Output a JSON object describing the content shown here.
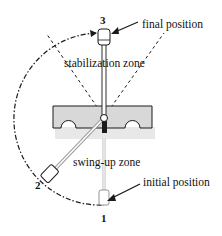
{
  "diagram": {
    "type": "pendulum-on-cart zones",
    "labels": {
      "final_position": "final position",
      "stabilization_zone": "stabilization zone",
      "swing_up_zone": "swing-up zone",
      "initial_position": "initial position"
    },
    "positions": [
      {
        "id": "1",
        "label": "1",
        "description": "initial position (hanging down)"
      },
      {
        "id": "2",
        "label": "2",
        "description": "intermediate swing position"
      },
      {
        "id": "3",
        "label": "3",
        "description": "final position (upright)"
      }
    ],
    "colors": {
      "ink": "#1a1a1a",
      "cart_fill": "#d8d8d8",
      "cart_shadow": "#e6e6e6",
      "background": "#ffffff"
    }
  }
}
